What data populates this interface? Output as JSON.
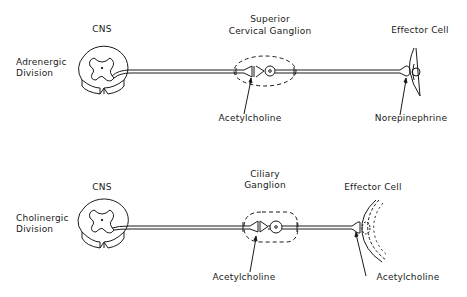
{
  "diagram": {
    "type": "autonomic-nervous-system-pathways",
    "colors": {
      "ink": "#1a1a1a",
      "background": "#ffffff"
    },
    "rows": [
      {
        "division_label": [
          "Adrenergic",
          "Division"
        ],
        "cns_label": "CNS",
        "ganglion_label": [
          "Superior",
          "Cervical Ganglion"
        ],
        "ganglion_transmitter": "Acetylcholine",
        "effector_label": "Effector Cell",
        "effector_transmitter": "Norepinephrine"
      },
      {
        "division_label": [
          "Cholinergic",
          "Division"
        ],
        "cns_label": "CNS",
        "ganglion_label": [
          "Ciliary",
          "Ganglion"
        ],
        "ganglion_transmitter": "Acetylcholine",
        "effector_label": "Effector Cell",
        "effector_transmitter": "Acetylcholine"
      }
    ]
  }
}
